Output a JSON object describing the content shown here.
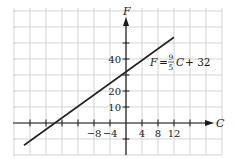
{
  "chart_data": {
    "type": "line",
    "title": "",
    "xlabel": "C",
    "ylabel": "F",
    "equation": {
      "lhs": "F",
      "equals": "=",
      "numerator": "9",
      "denominator": "5",
      "variable": "C",
      "rest": "+ 32"
    },
    "series": [
      {
        "name": "F = 9/5 C + 32",
        "slope": 1.8,
        "intercept": 32,
        "x": [
          -25.5,
          12
        ],
        "y": [
          -13.9,
          53.6
        ]
      }
    ],
    "x_ticks": [
      -24,
      -20,
      -16,
      -12,
      -8,
      -4,
      4,
      8,
      12,
      16
    ],
    "x_tick_labels": [
      {
        "value": -8,
        "label": "−8"
      },
      {
        "value": -4,
        "label": "−4"
      },
      {
        "value": 4,
        "label": "4"
      },
      {
        "value": 8,
        "label": "8"
      },
      {
        "value": 12,
        "label": "12"
      }
    ],
    "y_ticks": [
      -10,
      10,
      20,
      30,
      40,
      50
    ],
    "y_tick_labels": [
      {
        "value": 10,
        "label": "10"
      },
      {
        "value": 20,
        "label": "20"
      },
      {
        "value": 40,
        "label": "40"
      }
    ],
    "xlim": [
      -28,
      24
    ],
    "ylim": [
      -20,
      72
    ],
    "grid": true,
    "grid_step_x": 4,
    "grid_step_y": 10,
    "colors": {
      "line": "#222222",
      "grid": "#c8c8c8",
      "axis": "#1a1a1a"
    }
  }
}
